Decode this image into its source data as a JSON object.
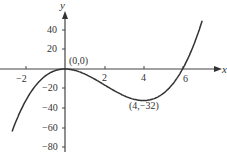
{
  "chart_data": {
    "type": "line",
    "title": "",
    "xlabel": "x",
    "ylabel": "y",
    "function": "y = x^3 - 6x^2",
    "xlim": [
      -2.7,
      7.3
    ],
    "ylim": [
      -80,
      50
    ],
    "grid": false,
    "x_ticks": [
      -2,
      2,
      4,
      6
    ],
    "x_tick_labels": [
      "−2",
      "2",
      "4",
      "6"
    ],
    "y_ticks": [
      40,
      20,
      -20,
      -40,
      -60,
      -80
    ],
    "y_tick_labels": [
      "40",
      "20",
      "−20",
      "−40",
      "−60",
      "−80"
    ],
    "series": [
      {
        "name": "y = x^3 - 6x^2",
        "x": [
          -2.6,
          -2,
          -1,
          0,
          1,
          2,
          3,
          4,
          5,
          6,
          7,
          7.3
        ],
        "y": [
          -58.1,
          -32,
          -7,
          0,
          -5,
          -16,
          -27,
          -32,
          -25,
          0,
          49,
          69.4
        ]
      }
    ],
    "annotations": [
      {
        "text": "(0,0)",
        "x": 0,
        "y": 0
      },
      {
        "text": "(4,−32)",
        "x": 4,
        "y": -32
      }
    ]
  }
}
